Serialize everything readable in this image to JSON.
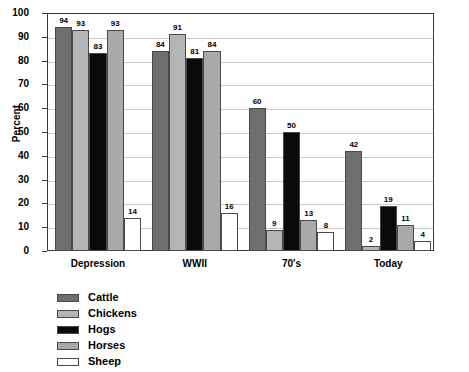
{
  "chart_data": {
    "type": "bar",
    "title": "",
    "subtitle": "",
    "xlabel": "",
    "ylabel": "Percent",
    "ylim": [
      0,
      100
    ],
    "ytick_step": 10,
    "yticks": [
      100,
      90,
      80,
      70,
      60,
      50,
      40,
      30,
      20,
      10,
      0
    ],
    "grid": true,
    "legend_position": "below-left",
    "categories": [
      "Depression",
      "WWII",
      "70's",
      "Today"
    ],
    "series": [
      {
        "name": "Cattle",
        "color": "#6e6e6e",
        "values": [
          94,
          84,
          60,
          42
        ]
      },
      {
        "name": "Chickens",
        "color": "#b4b4b4",
        "values": [
          93,
          91,
          9,
          2
        ]
      },
      {
        "name": "Hogs",
        "color": "#0a0a0a",
        "values": [
          83,
          81,
          50,
          19
        ]
      },
      {
        "name": "Horses",
        "color": "#a9a9a9",
        "values": [
          93,
          84,
          13,
          11
        ]
      },
      {
        "name": "Sheep",
        "color": "#ffffff",
        "values": [
          14,
          16,
          8,
          4
        ]
      }
    ]
  },
  "axis": {
    "y_title": "Percent"
  },
  "colors": {
    "frame": "#3a3a3a",
    "gridline": "#c9c9c9",
    "bar_outline": "#4a4a4a",
    "background": "#ffffff",
    "text": "#000000"
  }
}
